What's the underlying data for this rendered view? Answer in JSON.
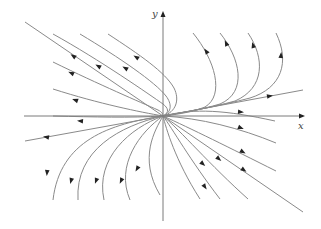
{
  "diagram": {
    "type": "phase-portrait",
    "axes": {
      "x_label": "x",
      "y_label": "y",
      "origin": [
        163,
        116
      ],
      "x_axis": {
        "from": [
          24,
          116
        ],
        "to": [
          303,
          116
        ]
      },
      "y_axis": {
        "from": [
          163,
          221
        ],
        "to": [
          163,
          13
        ]
      }
    },
    "colors": {
      "trajectory": "#8a8a8a",
      "axis": "#7a7a7a",
      "arrow": "#222222"
    },
    "trajectories": [
      {
        "id": "eig-slow",
        "d": "M25,141 L163,116 L303,90"
      },
      {
        "id": "eig-fast",
        "d": "M25,22 L163,116 L303,212"
      },
      {
        "id": "tl-1",
        "d": "M53,34 C100,60 150,95 163,104 C168,108 170,112 163,116"
      },
      {
        "id": "tl-2",
        "d": "M80,34 C120,58 155,82 166,96 C172,104 172,112 163,116"
      },
      {
        "id": "tl-3",
        "d": "M108,34 C140,55 165,72 174,88 C180,100 176,112 163,116"
      },
      {
        "id": "tl-4",
        "d": "M53,62 C100,85 140,102 158,110 C162,112 163,114 163,116"
      },
      {
        "id": "tl-5",
        "d": "M53,89 C100,104 140,112 163,116"
      },
      {
        "id": "tr-1",
        "d": "M193,33 C215,60 225,95 205,107 C190,113 172,115 163,116"
      },
      {
        "id": "tr-2",
        "d": "M220,33 C240,58 248,92 220,104 C200,110 175,114 163,116"
      },
      {
        "id": "tr-3",
        "d": "M248,33 C265,58 265,88 235,101 C210,108 180,113 163,116"
      },
      {
        "id": "tr-4",
        "d": "M276,33 C290,62 282,88 250,98 C220,106 185,112 163,116"
      },
      {
        "id": "r-1",
        "d": "M163,116 C195,108 225,110 275,121"
      },
      {
        "id": "br-1",
        "d": "M163,116 C200,118 240,128 276,143"
      },
      {
        "id": "br-2",
        "d": "M163,116 C190,128 230,148 276,171"
      },
      {
        "id": "br-3",
        "d": "M163,116 C180,130 210,165 248,199"
      },
      {
        "id": "br-4",
        "d": "M163,116 C172,128 190,160 220,199"
      },
      {
        "id": "br-5",
        "d": "M163,116 C166,128 175,160 200,199"
      },
      {
        "id": "l-1",
        "d": "M163,116 C130,118 95,117 53,116"
      },
      {
        "id": "bl-1",
        "d": "M163,116 C110,124 60,140 53,200"
      },
      {
        "id": "bl-2",
        "d": "M163,116 C120,126 75,150 78,200"
      },
      {
        "id": "bl-3",
        "d": "M163,116 C130,128 95,158 104,200"
      },
      {
        "id": "bl-4",
        "d": "M163,116 C140,132 115,165 130,200"
      },
      {
        "id": "bl-5",
        "d": "M163,116 C155,130 138,158 160,195"
      }
    ],
    "arrows": [
      {
        "at": [
          73,
          56
        ],
        "angle": 214
      },
      {
        "at": [
          98,
          66
        ],
        "angle": 210
      },
      {
        "at": [
          125,
          68
        ],
        "angle": 210
      },
      {
        "at": [
          136,
          57
        ],
        "angle": 212
      },
      {
        "at": [
          71,
          73
        ],
        "angle": 205
      },
      {
        "at": [
          75,
          100
        ],
        "angle": 200
      },
      {
        "at": [
          46,
          137
        ],
        "angle": 190
      },
      {
        "at": [
          80,
          121
        ],
        "angle": 185
      },
      {
        "at": [
          47,
          173
        ],
        "angle": 95
      },
      {
        "at": [
          71,
          181
        ],
        "angle": 105
      },
      {
        "at": [
          96,
          181
        ],
        "angle": 110
      },
      {
        "at": [
          121,
          181
        ],
        "angle": 115
      },
      {
        "at": [
          137,
          169
        ],
        "angle": 120
      },
      {
        "at": [
          206,
          51
        ],
        "angle": 235
      },
      {
        "at": [
          226,
          43
        ],
        "angle": 245
      },
      {
        "at": [
          253,
          45
        ],
        "angle": 255
      },
      {
        "at": [
          281,
          55
        ],
        "angle": 275
      },
      {
        "at": [
          270,
          96
        ],
        "angle": -10
      },
      {
        "at": [
          241,
          112
        ],
        "angle": 5
      },
      {
        "at": [
          241,
          128
        ],
        "angle": 22
      },
      {
        "at": [
          243,
          152
        ],
        "angle": 30
      },
      {
        "at": [
          244,
          170
        ],
        "angle": 35
      },
      {
        "at": [
          219,
          159
        ],
        "angle": 40
      },
      {
        "at": [
          203,
          164
        ],
        "angle": 42
      },
      {
        "at": [
          205,
          187
        ],
        "angle": 55
      }
    ]
  }
}
